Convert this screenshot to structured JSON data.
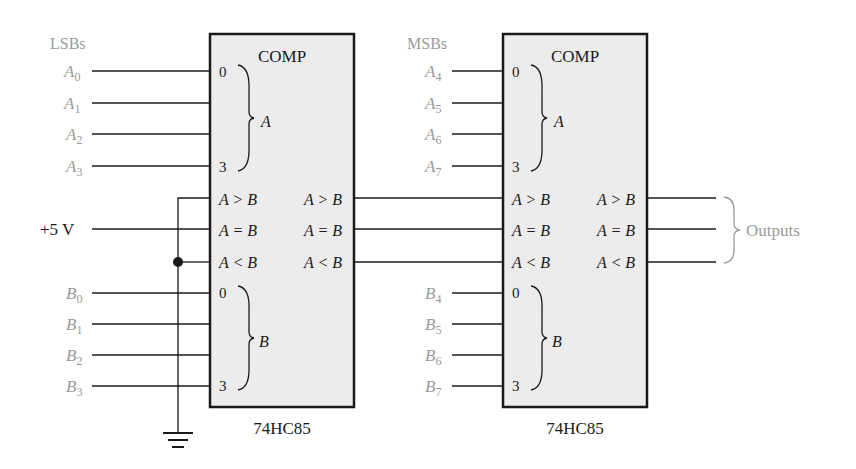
{
  "labels": {
    "lsbs": "LSBs",
    "msbs": "MSBs",
    "supply": "+5 V",
    "outputs": "Outputs"
  },
  "chips": [
    {
      "title": "COMP",
      "part": "74HC85",
      "a_group": "A",
      "b_group": "B",
      "pin_first": "0",
      "pin_last": "3",
      "cascade_inputs": [
        "A > B",
        "A = B",
        "A < B"
      ],
      "outputs": [
        "A > B",
        "A = B",
        "A < B"
      ],
      "a_inputs": [
        {
          "base": "A",
          "sub": "0"
        },
        {
          "base": "A",
          "sub": "1"
        },
        {
          "base": "A",
          "sub": "2"
        },
        {
          "base": "A",
          "sub": "3"
        }
      ],
      "b_inputs": [
        {
          "base": "B",
          "sub": "0"
        },
        {
          "base": "B",
          "sub": "1"
        },
        {
          "base": "B",
          "sub": "2"
        },
        {
          "base": "B",
          "sub": "3"
        }
      ]
    },
    {
      "title": "COMP",
      "part": "74HC85",
      "a_group": "A",
      "b_group": "B",
      "pin_first": "0",
      "pin_last": "3",
      "cascade_inputs": [
        "A > B",
        "A = B",
        "A < B"
      ],
      "outputs": [
        "A > B",
        "A = B",
        "A < B"
      ],
      "a_inputs": [
        {
          "base": "A",
          "sub": "4"
        },
        {
          "base": "A",
          "sub": "5"
        },
        {
          "base": "A",
          "sub": "6"
        },
        {
          "base": "A",
          "sub": "7"
        }
      ],
      "b_inputs": [
        {
          "base": "B",
          "sub": "4"
        },
        {
          "base": "B",
          "sub": "5"
        },
        {
          "base": "B",
          "sub": "6"
        },
        {
          "base": "B",
          "sub": "7"
        }
      ]
    }
  ],
  "colors": {
    "chip_fill": "#ececec",
    "line": "#1a1a1a",
    "label_gray": "#9a9a9a"
  }
}
